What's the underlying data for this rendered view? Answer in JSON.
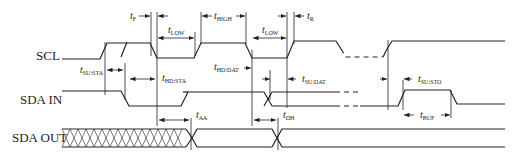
{
  "signals": [
    {
      "name": "SCL"
    },
    {
      "name": "SDA IN"
    },
    {
      "name": "SDA OUT"
    }
  ],
  "timing_params": {
    "tF": {
      "main": "t",
      "sub": "F"
    },
    "tLOW1": {
      "main": "t",
      "sub": "LOW"
    },
    "tHIGH": {
      "main": "t",
      "sub": "HIGH"
    },
    "tLOW2": {
      "main": "t",
      "sub": "LOW"
    },
    "tR": {
      "main": "t",
      "sub": "R"
    },
    "tSUSTA": {
      "main": "t",
      "sub": "SU:STA"
    },
    "tHDSTA": {
      "main": "t",
      "sub": "HD:STA"
    },
    "tHDDAT": {
      "main": "t",
      "sub": "HD:DAT"
    },
    "tSUDAT": {
      "main": "t",
      "sub": "SU:DAT"
    },
    "tSUSTO": {
      "main": "t",
      "sub": "SU:STO"
    },
    "tBUF": {
      "main": "t",
      "sub": "BUF"
    },
    "tAA": {
      "main": "t",
      "sub": "AA"
    },
    "tDH": {
      "main": "t",
      "sub": "DH"
    }
  }
}
